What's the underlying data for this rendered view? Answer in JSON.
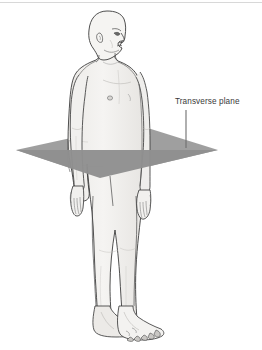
{
  "figure": {
    "background_color": "#ffffff",
    "top_rule_color": "#d8d8d8"
  },
  "annotations": {
    "plane_label": "Transverse plane",
    "label_color": "#3a3a3a",
    "leader_line_color": "#6e6e6e"
  },
  "plane": {
    "name": "transverse-plane",
    "fill_color": "#9a9a9a",
    "fill_color_front": "#8f8f8f",
    "opacity": "0.92"
  },
  "body": {
    "skin_fill": "#f3f2f0",
    "skin_shade": "#e4e3e0",
    "outline_color": "#3c3c3c",
    "detail_color": "#5a5a5a",
    "parts": [
      "head",
      "ear",
      "eye",
      "nose",
      "mouth",
      "neck",
      "torso",
      "chest",
      "nipple",
      "navel",
      "left-arm",
      "right-arm",
      "left-hand",
      "right-hand",
      "left-leg",
      "right-leg",
      "left-foot",
      "right-foot"
    ]
  }
}
